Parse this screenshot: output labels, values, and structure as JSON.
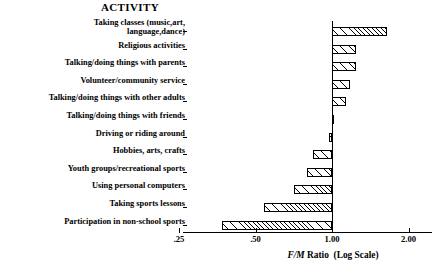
{
  "chart_data": {
    "type": "bar",
    "orientation": "horizontal",
    "title": "ACTIVITY",
    "xlabel": "F/M Ratio  (Log Scale)",
    "ylabel": "",
    "xscale": "log",
    "xlim": [
      0.25,
      2.1
    ],
    "xticks": [
      0.25,
      0.5,
      1.0,
      2.0
    ],
    "xticklabels": [
      ".25",
      ".50",
      "1.00",
      "2.00"
    ],
    "grid": false,
    "legend": null,
    "reference_line": 1.0,
    "baseline": 1.0,
    "categories": [
      "Taking classes (music,art,\nlanguage,dance)",
      "Religious activities",
      "Talking/doing things with parents",
      "Volunteer/community service",
      "Talking/doing things with other adults",
      "Talking/doing things with friends",
      "Driving or riding around",
      "Hobbies, arts, crafts",
      "Youth groups/recreational sports",
      "Using personal computers",
      "Taking sports lessons",
      "Participation in non-school sports"
    ],
    "values": [
      1.65,
      1.24,
      1.24,
      1.18,
      1.14,
      1.0,
      0.97,
      0.84,
      0.8,
      0.71,
      0.54,
      0.37
    ],
    "bar_fill": "diagonal-hatch",
    "bar_edge_color": "#000000"
  }
}
